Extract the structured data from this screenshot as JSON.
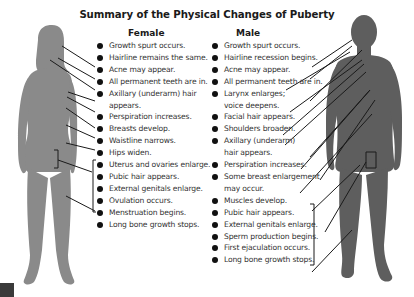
{
  "title": "Summary of the Physical Changes of Puberty",
  "female": {
    "heading": "Female",
    "items": [
      {
        "text": "Growth spurt occurs.",
        "bullet": true
      },
      {
        "text": "Hairline remains the same.",
        "bullet": true
      },
      {
        "text": "Acne may appear.",
        "bullet": true
      },
      {
        "text": "All permanent teeth are in.",
        "bullet": true
      },
      {
        "text": "Axillary (underarm) hair",
        "bullet": true
      },
      {
        "text": "appears.",
        "bullet": false
      },
      {
        "text": "Perspiration increases.",
        "bullet": true
      },
      {
        "text": "Breasts develop.",
        "bullet": true
      },
      {
        "text": "Waistline narrows.",
        "bullet": true
      },
      {
        "text": "Hips widen.",
        "bullet": true
      },
      {
        "text": "Uterus and ovaries enlarge.",
        "bullet": true
      },
      {
        "text": "Pubic hair appears.",
        "bullet": true
      },
      {
        "text": "External genitals enlarge.",
        "bullet": true
      },
      {
        "text": "Ovulation occurs.",
        "bullet": true
      },
      {
        "text": "Menstruation begins.",
        "bullet": true
      },
      {
        "text": "Long bone growth stops.",
        "bullet": true
      }
    ]
  },
  "male": {
    "heading": "Male",
    "items": [
      {
        "text": "Growth spurt occurs.",
        "bullet": true
      },
      {
        "text": "Hairline recession begins.",
        "bullet": true
      },
      {
        "text": "Acne may appear.",
        "bullet": true
      },
      {
        "text": "All permanent teeth are in.",
        "bullet": true
      },
      {
        "text": "Larynx enlarges;",
        "bullet": true
      },
      {
        "text": "voice deepens.",
        "bullet": false
      },
      {
        "text": "Facial hair appears.",
        "bullet": true
      },
      {
        "text": "Shoulders broaden.",
        "bullet": true
      },
      {
        "text": "Axillary (underarm)",
        "bullet": true
      },
      {
        "text": "hair appears.",
        "bullet": false
      },
      {
        "text": "Perspiration increases.",
        "bullet": true
      },
      {
        "text": "Some breast enlargement",
        "bullet": true
      },
      {
        "text": "may occur.",
        "bullet": false
      },
      {
        "text": "Muscles develop.",
        "bullet": true
      },
      {
        "text": "Pubic hair appears.",
        "bullet": true
      },
      {
        "text": "External genitals enlarge.",
        "bullet": true
      },
      {
        "text": "Sperm production begins.",
        "bullet": true
      },
      {
        "text": "First ejaculation occurs.",
        "bullet": true
      },
      {
        "text": "Long bone growth stops.",
        "bullet": true
      }
    ]
  },
  "colors": {
    "female_silhouette": "#8a8a8a",
    "male_silhouette": "#5e5e5e",
    "leader_lines": "#1a1a1a",
    "text": "#333333",
    "bullet": "#111111"
  }
}
